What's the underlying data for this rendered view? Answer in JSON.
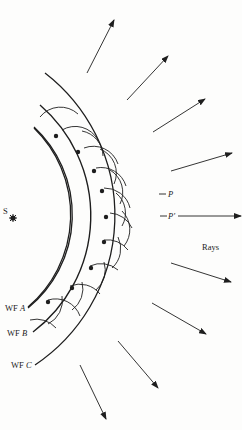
{
  "diagram": {
    "source_label": "S",
    "wavefronts": [
      {
        "id": "A",
        "prefix": "WF",
        "letter": "A"
      },
      {
        "id": "B",
        "prefix": "WF",
        "letter": "B"
      },
      {
        "id": "C",
        "prefix": "WF",
        "letter": "C"
      }
    ],
    "points": {
      "p": "P",
      "p_prime": "P′"
    },
    "rays_label": "Rays",
    "colors": {
      "ink": "#1e1e1e",
      "background": "#fdfdfc"
    }
  }
}
